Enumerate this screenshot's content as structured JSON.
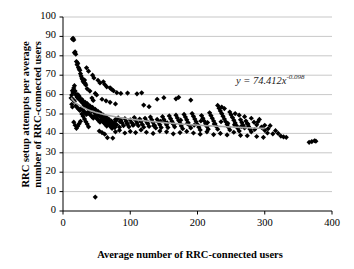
{
  "chart_data": {
    "type": "scatter",
    "title": "",
    "xlabel": "Average number of RRC-connected users",
    "ylabel": "RRC setup attempts per average number of RRC-connected users",
    "xlim": [
      0,
      400
    ],
    "ylim": [
      0,
      100
    ],
    "xticks": [
      0,
      100,
      200,
      300,
      400
    ],
    "yticks": [
      0,
      10,
      20,
      30,
      40,
      50,
      60,
      70,
      80,
      90,
      100
    ],
    "grid": "horizontal",
    "legend": "none",
    "marker": "diamond",
    "marker_color": "#000000",
    "trendline": {
      "type": "power",
      "equation": "y = 74.412x",
      "exponent": "-0.098",
      "coefficient": 74.412,
      "power": -0.098,
      "color": "#a6a6a6"
    },
    "points": [
      [
        14,
        88.6
      ],
      [
        15,
        89.0
      ],
      [
        16,
        88.2
      ],
      [
        17,
        81.6
      ],
      [
        18,
        82.0
      ],
      [
        19,
        80.8
      ],
      [
        20,
        77.0
      ],
      [
        21,
        75.4
      ],
      [
        22,
        76.2
      ],
      [
        23,
        74.0
      ],
      [
        24,
        73.2
      ],
      [
        25,
        72.5
      ],
      [
        26,
        70.8
      ],
      [
        27,
        69.6
      ],
      [
        28,
        68.5
      ],
      [
        29,
        67.8
      ],
      [
        30,
        66.9
      ],
      [
        31,
        66.2
      ],
      [
        32,
        67.5
      ],
      [
        33,
        65.8
      ],
      [
        34,
        64.9
      ],
      [
        35,
        73.8
      ],
      [
        38,
        72.1
      ],
      [
        44,
        70.0
      ],
      [
        46,
        68.6
      ],
      [
        52,
        67.4
      ],
      [
        55,
        66.0
      ],
      [
        60,
        66.6
      ],
      [
        62,
        65.2
      ],
      [
        65,
        64.0
      ],
      [
        70,
        63.5
      ],
      [
        72,
        62.8
      ],
      [
        75,
        62.0
      ],
      [
        80,
        61.0
      ],
      [
        86,
        60.6
      ],
      [
        96,
        60.8
      ],
      [
        110,
        60.4
      ],
      [
        117,
        60.9
      ],
      [
        14,
        62.0
      ],
      [
        15,
        61.2
      ],
      [
        16,
        63.4
      ],
      [
        17,
        64.6
      ],
      [
        18,
        61.8
      ],
      [
        19,
        60.2
      ],
      [
        20,
        59.4
      ],
      [
        21,
        58.6
      ],
      [
        22,
        60.0
      ],
      [
        23,
        57.8
      ],
      [
        24,
        59.2
      ],
      [
        25,
        58.0
      ],
      [
        26,
        57.2
      ],
      [
        27,
        56.4
      ],
      [
        28,
        57.6
      ],
      [
        29,
        55.8
      ],
      [
        30,
        56.6
      ],
      [
        31,
        55.0
      ],
      [
        32,
        54.4
      ],
      [
        33,
        56.0
      ],
      [
        34,
        54.8
      ],
      [
        35,
        53.9
      ],
      [
        36,
        55.4
      ],
      [
        37,
        54.0
      ],
      [
        38,
        53.2
      ],
      [
        39,
        52.6
      ],
      [
        40,
        54.2
      ],
      [
        41,
        53.0
      ],
      [
        42,
        52.2
      ],
      [
        43,
        51.6
      ],
      [
        44,
        53.4
      ],
      [
        45,
        52.0
      ],
      [
        46,
        51.2
      ],
      [
        47,
        50.6
      ],
      [
        48,
        52.4
      ],
      [
        49,
        51.0
      ],
      [
        50,
        50.2
      ],
      [
        51,
        49.6
      ],
      [
        52,
        51.4
      ],
      [
        53,
        50.0
      ],
      [
        54,
        49.2
      ],
      [
        55,
        48.6
      ],
      [
        56,
        50.4
      ],
      [
        57,
        49.0
      ],
      [
        58,
        48.2
      ],
      [
        59,
        47.6
      ],
      [
        60,
        49.4
      ],
      [
        61,
        48.0
      ],
      [
        62,
        47.2
      ],
      [
        63,
        46.6
      ],
      [
        64,
        48.4
      ],
      [
        65,
        47.0
      ],
      [
        66,
        46.2
      ],
      [
        67,
        45.6
      ],
      [
        68,
        47.4
      ],
      [
        69,
        46.0
      ],
      [
        70,
        45.2
      ],
      [
        71,
        44.6
      ],
      [
        72,
        46.4
      ],
      [
        73,
        45.0
      ],
      [
        74,
        44.2
      ],
      [
        75,
        43.6
      ],
      [
        76,
        45.4
      ],
      [
        77,
        44.0
      ],
      [
        78,
        47.2
      ],
      [
        79,
        46.6
      ],
      [
        80,
        44.4
      ],
      [
        82,
        48.0
      ],
      [
        84,
        43.2
      ],
      [
        86,
        46.8
      ],
      [
        88,
        45.4
      ],
      [
        90,
        44.0
      ],
      [
        92,
        47.6
      ],
      [
        94,
        46.2
      ],
      [
        96,
        44.8
      ],
      [
        98,
        43.4
      ],
      [
        100,
        47.0
      ],
      [
        102,
        45.6
      ],
      [
        104,
        44.2
      ],
      [
        106,
        48.2
      ],
      [
        108,
        46.8
      ],
      [
        110,
        45.4
      ],
      [
        112,
        44.0
      ],
      [
        114,
        47.4
      ],
      [
        116,
        46.0
      ],
      [
        118,
        44.6
      ],
      [
        120,
        43.2
      ],
      [
        122,
        47.8
      ],
      [
        124,
        46.4
      ],
      [
        126,
        45.0
      ],
      [
        128,
        43.6
      ],
      [
        130,
        48.4
      ],
      [
        132,
        47.0
      ],
      [
        134,
        45.6
      ],
      [
        136,
        44.2
      ],
      [
        138,
        42.8
      ],
      [
        140,
        47.2
      ],
      [
        142,
        45.8
      ],
      [
        144,
        44.4
      ],
      [
        146,
        43.0
      ],
      [
        148,
        48.6
      ],
      [
        150,
        47.2
      ],
      [
        152,
        45.8
      ],
      [
        154,
        44.4
      ],
      [
        156,
        43.0
      ],
      [
        158,
        49.0
      ],
      [
        160,
        47.6
      ],
      [
        162,
        46.2
      ],
      [
        164,
        44.8
      ],
      [
        166,
        43.4
      ],
      [
        168,
        49.4
      ],
      [
        170,
        48.0
      ],
      [
        172,
        46.6
      ],
      [
        174,
        45.2
      ],
      [
        176,
        43.8
      ],
      [
        178,
        42.4
      ],
      [
        180,
        49.8
      ],
      [
        182,
        48.4
      ],
      [
        184,
        47.0
      ],
      [
        186,
        45.6
      ],
      [
        188,
        44.2
      ],
      [
        190,
        42.8
      ],
      [
        192,
        50.2
      ],
      [
        194,
        48.8
      ],
      [
        196,
        47.4
      ],
      [
        198,
        46.0
      ],
      [
        200,
        44.6
      ],
      [
        202,
        43.2
      ],
      [
        204,
        41.8
      ],
      [
        206,
        49.2
      ],
      [
        208,
        47.8
      ],
      [
        210,
        46.4
      ],
      [
        212,
        45.0
      ],
      [
        214,
        43.6
      ],
      [
        216,
        42.2
      ],
      [
        218,
        50.6
      ],
      [
        220,
        49.2
      ],
      [
        222,
        47.8
      ],
      [
        224,
        46.4
      ],
      [
        226,
        45.0
      ],
      [
        228,
        43.6
      ],
      [
        230,
        42.2
      ],
      [
        232,
        53.0
      ],
      [
        234,
        51.6
      ],
      [
        236,
        50.2
      ],
      [
        238,
        48.8
      ],
      [
        240,
        47.4
      ],
      [
        242,
        46.0
      ],
      [
        244,
        44.6
      ],
      [
        246,
        43.2
      ],
      [
        248,
        41.8
      ],
      [
        250,
        49.6
      ],
      [
        252,
        48.2
      ],
      [
        254,
        46.8
      ],
      [
        256,
        45.4
      ],
      [
        258,
        44.0
      ],
      [
        260,
        42.6
      ],
      [
        262,
        41.2
      ],
      [
        264,
        47.0
      ],
      [
        266,
        45.6
      ],
      [
        268,
        44.2
      ],
      [
        270,
        42.8
      ],
      [
        272,
        46.4
      ],
      [
        274,
        45.0
      ],
      [
        276,
        43.6
      ],
      [
        278,
        42.2
      ],
      [
        280,
        40.8
      ],
      [
        284,
        45.8
      ],
      [
        288,
        44.4
      ],
      [
        292,
        47.2
      ],
      [
        296,
        43.0
      ],
      [
        300,
        41.6
      ],
      [
        304,
        40.2
      ],
      [
        308,
        44.0
      ],
      [
        312,
        39.8
      ],
      [
        316,
        41.4
      ],
      [
        320,
        40.0
      ],
      [
        324,
        38.6
      ],
      [
        328,
        38.2
      ],
      [
        332,
        38.0
      ],
      [
        366,
        35.4
      ],
      [
        370,
        35.8
      ],
      [
        374,
        36.2
      ],
      [
        376,
        36.0
      ],
      [
        140,
        57.6
      ],
      [
        150,
        58.4
      ],
      [
        168,
        57.8
      ],
      [
        172,
        58.6
      ],
      [
        190,
        57.2
      ],
      [
        120,
        54.6
      ],
      [
        128,
        53.8
      ],
      [
        58,
        57.6
      ],
      [
        64,
        56.8
      ],
      [
        70,
        56.0
      ],
      [
        78,
        55.2
      ],
      [
        36,
        63.0
      ],
      [
        40,
        61.8
      ],
      [
        48,
        60.6
      ],
      [
        50,
        59.8
      ],
      [
        43,
        58.2
      ],
      [
        45,
        57.0
      ],
      [
        28,
        50.0
      ],
      [
        30,
        48.8
      ],
      [
        32,
        47.4
      ],
      [
        34,
        46.0
      ],
      [
        36,
        44.8
      ],
      [
        38,
        43.4
      ],
      [
        26,
        46.2
      ],
      [
        24,
        45.0
      ],
      [
        22,
        43.8
      ],
      [
        20,
        42.6
      ],
      [
        18,
        44.2
      ],
      [
        16,
        45.8
      ],
      [
        54,
        41.2
      ],
      [
        58,
        40.4
      ],
      [
        62,
        39.6
      ],
      [
        66,
        37.8
      ],
      [
        74,
        37.6
      ],
      [
        78,
        40.8
      ],
      [
        84,
        41.6
      ],
      [
        92,
        40.2
      ],
      [
        100,
        41.0
      ],
      [
        108,
        40.4
      ],
      [
        116,
        41.8
      ],
      [
        124,
        40.6
      ],
      [
        134,
        40.0
      ],
      [
        144,
        41.2
      ],
      [
        154,
        40.8
      ],
      [
        164,
        39.8
      ],
      [
        174,
        40.4
      ],
      [
        184,
        41.0
      ],
      [
        194,
        40.2
      ],
      [
        204,
        39.6
      ],
      [
        214,
        40.8
      ],
      [
        224,
        39.4
      ],
      [
        234,
        40.0
      ],
      [
        244,
        39.2
      ],
      [
        254,
        40.6
      ],
      [
        264,
        39.0
      ],
      [
        274,
        38.8
      ],
      [
        288,
        38.4
      ],
      [
        298,
        38.0
      ],
      [
        48,
        7.2
      ],
      [
        19,
        54.2
      ],
      [
        21,
        53.4
      ],
      [
        23,
        52.6
      ],
      [
        25,
        51.8
      ],
      [
        27,
        53.0
      ],
      [
        29,
        52.2
      ],
      [
        31,
        51.4
      ],
      [
        33,
        50.6
      ],
      [
        35,
        49.8
      ],
      [
        37,
        51.0
      ],
      [
        39,
        50.2
      ],
      [
        41,
        49.4
      ],
      [
        43,
        48.6
      ],
      [
        45,
        47.8
      ],
      [
        47,
        49.0
      ],
      [
        49,
        48.2
      ],
      [
        51,
        47.4
      ],
      [
        53,
        46.6
      ],
      [
        55,
        45.8
      ],
      [
        57,
        47.0
      ],
      [
        59,
        46.2
      ],
      [
        61,
        45.4
      ],
      [
        63,
        44.6
      ],
      [
        65,
        43.8
      ],
      [
        67,
        45.0
      ],
      [
        69,
        44.2
      ],
      [
        71,
        43.4
      ],
      [
        73,
        42.6
      ],
      [
        75,
        44.8
      ],
      [
        77,
        43.0
      ],
      [
        85,
        46.0
      ],
      [
        95,
        45.2
      ],
      [
        105,
        44.4
      ],
      [
        115,
        46.6
      ],
      [
        125,
        45.8
      ],
      [
        135,
        44.0
      ],
      [
        145,
        46.2
      ],
      [
        155,
        45.4
      ],
      [
        165,
        44.6
      ],
      [
        175,
        46.8
      ],
      [
        185,
        45.0
      ],
      [
        195,
        44.2
      ],
      [
        205,
        46.4
      ],
      [
        215,
        45.6
      ],
      [
        225,
        44.8
      ],
      [
        235,
        46.0
      ],
      [
        245,
        45.2
      ],
      [
        255,
        44.4
      ],
      [
        265,
        43.6
      ],
      [
        275,
        44.8
      ],
      [
        285,
        42.0
      ],
      [
        295,
        43.2
      ],
      [
        305,
        42.4
      ],
      [
        15,
        57.4
      ],
      [
        17,
        56.6
      ],
      [
        13,
        59.8
      ],
      [
        12,
        58.2
      ],
      [
        13,
        55.0
      ],
      [
        14,
        53.6
      ],
      [
        230,
        54.4
      ],
      [
        236,
        53.6
      ],
      [
        240,
        52.8
      ],
      [
        248,
        51.0
      ],
      [
        256,
        50.2
      ],
      [
        262,
        49.4
      ],
      [
        270,
        48.6
      ],
      [
        280,
        47.8
      ],
      [
        290,
        46.0
      ],
      [
        300,
        44.2
      ]
    ]
  }
}
